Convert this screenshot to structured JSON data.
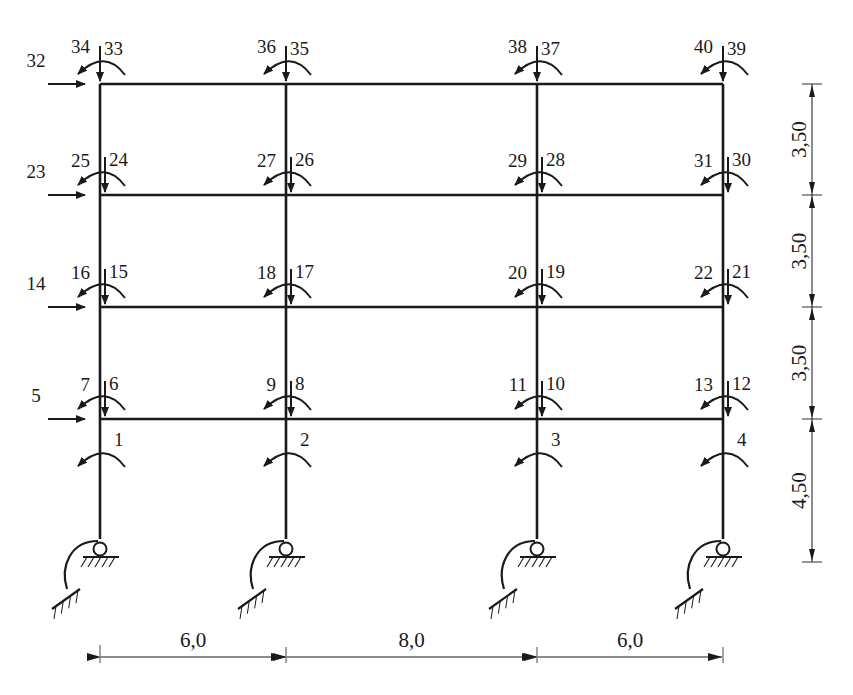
{
  "diagram": {
    "type": "plane-frame-dof-scheme",
    "colors": {
      "ink": "#1a1a1a",
      "background": "#ffffff"
    },
    "columns_x": [
      100,
      286,
      537,
      723
    ],
    "floors_y": [
      84,
      195,
      307,
      419
    ],
    "base_y": 547,
    "spans": {
      "labels": [
        "6,0",
        "8,0",
        "6,0"
      ]
    },
    "heights": {
      "labels": [
        "3,50",
        "3,50",
        "3,50",
        "4,50"
      ]
    },
    "base_dofs": [
      {
        "col": 0,
        "rot": "1"
      },
      {
        "col": 1,
        "rot": "2"
      },
      {
        "col": 2,
        "rot": "3"
      },
      {
        "col": 3,
        "rot": "4"
      }
    ],
    "floors": [
      {
        "level": 1,
        "horizontal": "5",
        "nodes": [
          {
            "vert": "6",
            "rot": "7"
          },
          {
            "vert": "8",
            "rot": "9"
          },
          {
            "vert": "10",
            "rot": "11"
          },
          {
            "vert": "12",
            "rot": "13"
          }
        ]
      },
      {
        "level": 2,
        "horizontal": "14",
        "nodes": [
          {
            "vert": "15",
            "rot": "16"
          },
          {
            "vert": "17",
            "rot": "18"
          },
          {
            "vert": "19",
            "rot": "20"
          },
          {
            "vert": "21",
            "rot": "22"
          }
        ]
      },
      {
        "level": 3,
        "horizontal": "23",
        "nodes": [
          {
            "vert": "24",
            "rot": "25"
          },
          {
            "vert": "26",
            "rot": "27"
          },
          {
            "vert": "28",
            "rot": "29"
          },
          {
            "vert": "30",
            "rot": "31"
          }
        ]
      },
      {
        "level": 4,
        "horizontal": "32",
        "nodes": [
          {
            "vert": "33",
            "rot": "34"
          },
          {
            "vert": "35",
            "rot": "36"
          },
          {
            "vert": "37",
            "rot": "38"
          },
          {
            "vert": "39",
            "rot": "40"
          }
        ]
      }
    ]
  }
}
